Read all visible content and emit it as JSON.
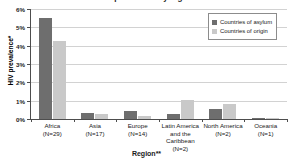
{
  "chart_data": {
    "type": "bar",
    "title": "HIV prevalence by region",
    "xlabel": "Region**",
    "ylabel": "HIV prevalence*",
    "categories": [
      "Africa",
      "Asia",
      "Europe",
      "Latin America and the Caribbean",
      "North America",
      "Oceania"
    ],
    "category_lines": [
      [
        "Africa",
        "(N=29)"
      ],
      [
        "Asia",
        "(N=17)"
      ],
      [
        "Europe",
        "(N=14)"
      ],
      [
        "Latin America",
        "and the Caribbean",
        "(N=2)"
      ],
      [
        "North America",
        "(N=2)"
      ],
      [
        "Oceania",
        "(N=1)"
      ]
    ],
    "counts": [
      29,
      17,
      14,
      2,
      2,
      1
    ],
    "series": [
      {
        "name": "Countries of asylum",
        "color": "#6e6e6e",
        "values": [
          5.5,
          0.35,
          0.45,
          0.25,
          0.55,
          0.05
        ]
      },
      {
        "name": "Countries of origin",
        "color": "#c9c9c9",
        "values": [
          4.25,
          0.3,
          0.15,
          1.05,
          0.8,
          0.05
        ]
      }
    ],
    "ylim": [
      0,
      6
    ],
    "yticks": [
      0,
      1,
      2,
      3,
      4,
      5,
      6
    ],
    "ytick_labels": [
      "0%",
      "1%",
      "2%",
      "3%",
      "4%",
      "5%",
      "6%"
    ],
    "grid": true,
    "legend_position": "top-right"
  }
}
